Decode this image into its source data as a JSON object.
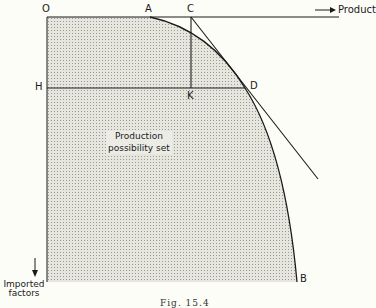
{
  "diagram": {
    "points": {
      "O": "O",
      "A": "A",
      "C": "C",
      "H": "H",
      "K": "K",
      "D": "D",
      "B": "B"
    },
    "axes": {
      "x_label": "Product",
      "y_label_line1": "Imported",
      "y_label_line2": "factors"
    },
    "region_label_line1": "Production",
    "region_label_line2": "possibility set",
    "caption": "Fig. 15.4",
    "colors": {
      "line": "#1a1a1a",
      "shade": "#d8d8d0",
      "background": "#fdfdf8"
    }
  }
}
